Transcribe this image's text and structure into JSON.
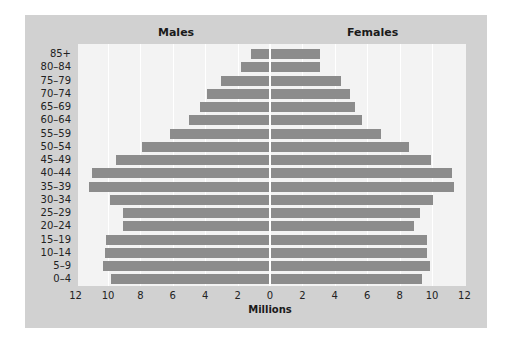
{
  "chart_data": {
    "type": "bar",
    "orientation": "horizontal",
    "subtype": "population-pyramid",
    "title": "",
    "xlabel": "Millions",
    "ylabel": "",
    "xlim": [
      -12,
      12
    ],
    "x_tick_labels": [
      "12",
      "10",
      "8",
      "6",
      "4",
      "2",
      "0",
      "2",
      "4",
      "6",
      "8",
      "10",
      "12"
    ],
    "grid": true,
    "categories": [
      "85+",
      "80–84",
      "75–79",
      "70–74",
      "65–69",
      "60–64",
      "55–59",
      "50–54",
      "45–49",
      "40–44",
      "35–39",
      "30–34",
      "25–29",
      "20–24",
      "15–19",
      "10–14",
      "5–9",
      "0–4"
    ],
    "series": [
      {
        "name": "Males",
        "side": "left",
        "values": [
          1.2,
          1.8,
          3.0,
          3.9,
          4.3,
          5.0,
          6.2,
          7.9,
          9.5,
          11.0,
          11.2,
          9.9,
          9.1,
          9.1,
          10.1,
          10.2,
          10.3,
          9.8
        ]
      },
      {
        "name": "Females",
        "side": "right",
        "values": [
          3.0,
          3.0,
          4.3,
          4.9,
          5.2,
          5.6,
          6.8,
          8.5,
          9.9,
          11.2,
          11.3,
          10.0,
          9.2,
          8.8,
          9.6,
          9.6,
          9.8,
          9.3
        ]
      }
    ],
    "colors": {
      "bar": "#8c8c8c",
      "panel": "#d1d1d1",
      "plot_bg": "#f3f3f3",
      "grid": "#ffffff"
    }
  },
  "labels": {
    "males": "Males",
    "females": "Females",
    "xaxis_title": "Millions"
  }
}
